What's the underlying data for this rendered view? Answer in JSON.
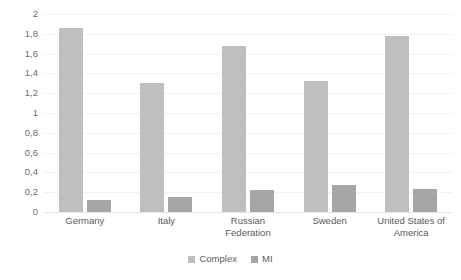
{
  "chart_data": {
    "type": "bar",
    "title": "",
    "subtitle": "",
    "xlabel": "",
    "ylabel": "",
    "ylim": [
      0,
      2
    ],
    "grid": true,
    "legend_position": "bottom-center",
    "decimal_separator": ",",
    "categories": [
      "Germany",
      "Italy",
      "Russian Federation",
      "Sweden",
      "United States of America"
    ],
    "ytick_labels": [
      "2",
      "1,8",
      "1,6",
      "1,4",
      "1,2",
      "1",
      "0,8",
      "0,6",
      "0,4",
      "0,2",
      "0"
    ],
    "ytick_values": [
      2,
      1.8,
      1.6,
      1.4,
      1.2,
      1,
      0.8,
      0.6,
      0.4,
      0.2,
      0
    ],
    "series": [
      {
        "name": "Complex",
        "color": "#bfbfbf",
        "values": [
          1.86,
          1.3,
          1.68,
          1.32,
          1.78
        ]
      },
      {
        "name": "MI",
        "color": "#a6a6a6",
        "values": [
          0.12,
          0.15,
          0.22,
          0.27,
          0.23
        ]
      }
    ]
  }
}
